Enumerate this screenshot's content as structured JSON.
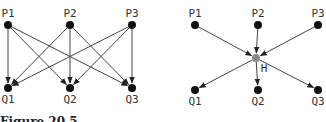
{
  "left_diagram": {
    "nodes_top": [
      {
        "label": "P1",
        "x": 8,
        "y": 25
      },
      {
        "label": "P2",
        "x": 70,
        "y": 25
      },
      {
        "label": "P3",
        "x": 132,
        "y": 25
      }
    ],
    "nodes_bottom": [
      {
        "label": "Q1",
        "x": 8,
        "y": 88
      },
      {
        "label": "Q2",
        "x": 70,
        "y": 88
      },
      {
        "label": "Q3",
        "x": 132,
        "y": 88
      }
    ],
    "edges": "every P connects to every Q"
  },
  "right_diagram": {
    "nodes_top": [
      {
        "label": "P1",
        "x": 195,
        "y": 25
      },
      {
        "label": "P2",
        "x": 258,
        "y": 25
      },
      {
        "label": "P3",
        "x": 318,
        "y": 25
      }
    ],
    "hub": {
      "label": "H",
      "x": 256,
      "y": 58,
      "color": "#888888"
    },
    "nodes_bottom": [
      {
        "label": "Q1",
        "x": 195,
        "y": 90
      },
      {
        "label": "Q2",
        "x": 258,
        "y": 90
      },
      {
        "label": "Q3",
        "x": 318,
        "y": 90
      }
    ]
  },
  "caption": "Figure 20.5",
  "colors": {
    "node": "#111111",
    "edge": "#444444",
    "hub": "#888888"
  }
}
